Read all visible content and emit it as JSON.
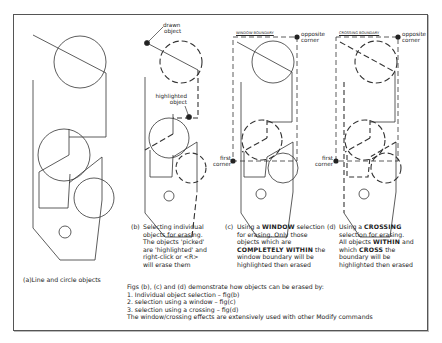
{
  "figures": {
    "a": {
      "caption": "(a)Line and circle objects"
    },
    "b": {
      "label_drawn": [
        "drawn",
        "object"
      ],
      "label_highlighted": [
        "highlighted",
        "object"
      ],
      "caption_prefix": "(b)",
      "caption_lines": [
        "Selecting individual",
        "objects for erasing.",
        "The objects 'picked'",
        "are 'highlighted' and",
        "right-click or <R>",
        "will erase them"
      ]
    },
    "c": {
      "boundary_label": "WINDOW BOUNDARY",
      "opposite_corner": [
        "opposite",
        "corner"
      ],
      "first_corner": [
        "first",
        "corner"
      ],
      "caption_prefix": "(c)",
      "caption": {
        "l1_a": "Using a ",
        "l1_b": "WINDOW",
        "l1_c": " selection",
        "l2": "for erasing. Only those",
        "l3": "objects which are",
        "l4_a": "COMPLETELY WITHIN",
        "l4_b": " the",
        "l5": "window boundary will be",
        "l6": "highlighted then erased"
      }
    },
    "d": {
      "boundary_label": "CROSSING BOUNDARY",
      "opposite_corner": [
        "opposite",
        "corner"
      ],
      "first_corner": [
        "first",
        "corner"
      ],
      "caption_prefix": "(d)",
      "caption": {
        "l1_a": "Using a ",
        "l1_b": "CROSSING",
        "l2": "selection for erasing.",
        "l3_a": "All objects ",
        "l3_b": "WITHIN",
        "l3_c": " and",
        "l4_a": "which ",
        "l4_b": "CROSS",
        "l4_c": " the",
        "l5": "boundary will be",
        "l6": "highlighted then erased"
      }
    }
  },
  "notes": {
    "intro": "Figs (b), (c) and (d) demonstrate how objects can be erased by:",
    "items": [
      "1. Individual object selection – fig(b)",
      "2. selection using a window – fig(c)",
      "3. selection using a crossing – fig(d)"
    ],
    "footer": "The window/crossing effects are extensively used with other Modify commands"
  },
  "colors": {
    "line": "#333333",
    "background": "#ffffff"
  }
}
